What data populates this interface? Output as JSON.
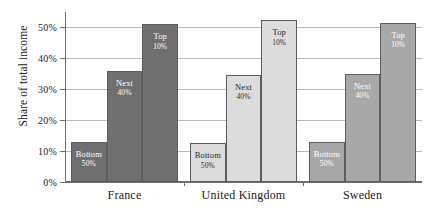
{
  "chart_data": {
    "type": "bar",
    "title": "",
    "xlabel": "",
    "ylabel": "Share of total income",
    "ylim": [
      0,
      55
    ],
    "grid": true,
    "legend": false,
    "categories": [
      "France",
      "United Kingdom",
      "Sweden"
    ],
    "ytick_labels": [
      "0%",
      "10%",
      "20%",
      "30%",
      "40%",
      "50%"
    ],
    "ytick_values": [
      0,
      10,
      20,
      30,
      40,
      50
    ],
    "series": [
      {
        "name": "Bottom 50%",
        "label_main": "Bottom",
        "label_sub": "50%",
        "values": [
          13.0,
          12.5,
          13.0
        ]
      },
      {
        "name": "Next 40%",
        "label_main": "Next",
        "label_sub": "40%",
        "values": [
          36.0,
          34.7,
          35.0
        ]
      },
      {
        "name": "Top 10%",
        "label_main": "Top",
        "label_sub": "10%",
        "values": [
          51.0,
          52.3,
          51.5
        ]
      }
    ],
    "group_colors": [
      "#6f6f6f",
      "#dcdcdc",
      "#a8a8a8"
    ],
    "group_label_tone": [
      "on-dark",
      "on-light",
      "on-dark"
    ],
    "axis_color": "#6e6e6e",
    "grid_color": "#b9b9b9",
    "bar_border_color": "#5d5d5d"
  }
}
